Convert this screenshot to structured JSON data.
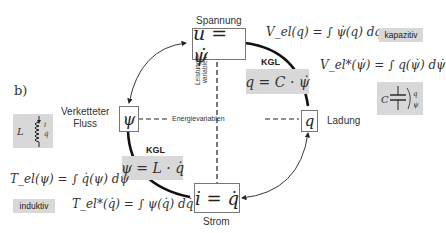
{
  "figure_label": "b)",
  "nodes": {
    "voltage": {
      "title": "Spannung",
      "formula": "u = ψ̇"
    },
    "charge": {
      "title": "Ladung",
      "formula": "q"
    },
    "current": {
      "title": "Strom",
      "formula": "i = q̇"
    },
    "flux": {
      "title_line1": "Verketteter",
      "title_line2": "Fluss",
      "formula": "ψ"
    }
  },
  "axes": {
    "power_variables_line1": "Leistungs-",
    "power_variables_line2": "variablen",
    "energy_variables": "Energievariablen"
  },
  "constitutive": {
    "capacitive": {
      "kgl_label": "KGL",
      "formula": "q = C · ψ̇"
    },
    "inductive": {
      "kgl_label": "KGL",
      "formula": "ψ = L · q̇"
    }
  },
  "capacitive": {
    "tag": "kapazitiv",
    "energy": "V_el(q) = ∫ ψ̇(q) dq",
    "coenergy": "V_el*(ψ̇) = ∫ q(ψ̇) dψ̇",
    "symbol": {
      "name": "C",
      "var1": "q",
      "var2": "ψ̇"
    }
  },
  "inductive": {
    "tag": "induktiv",
    "energy": "T_el(ψ) = ∫ q̇(ψ) dψ",
    "coenergy": "T_el*(q̇) = ∫ ψ(q̇) dq̇",
    "symbol": {
      "name": "L",
      "var1": "i",
      "var2": "q̇"
    }
  },
  "colors": {
    "box_border": "#777777",
    "highlight_bg": "#d8d8d8",
    "line": "#111111",
    "text": "#333333"
  }
}
